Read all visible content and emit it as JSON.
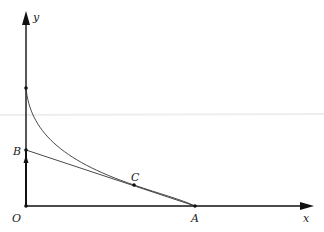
{
  "diagram": {
    "labels": {
      "y_axis": "y",
      "x_axis": "x",
      "origin": "O",
      "point_a": "A",
      "point_b": "B",
      "point_c": "C"
    },
    "colors": {
      "axis": "#111111",
      "curve": "#333333",
      "line": "#333333",
      "faint_line": "#f0f0f0"
    }
  }
}
